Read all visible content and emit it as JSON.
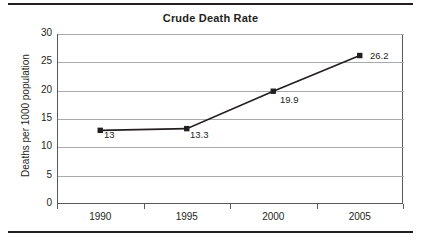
{
  "chart_data": {
    "type": "line",
    "title": "Crude Death Rate",
    "xlabel": "",
    "ylabel": "Deaths per 1000 population",
    "categories": [
      "1990",
      "1995",
      "2000",
      "2005"
    ],
    "values": [
      13,
      13.3,
      19.9,
      26.2
    ],
    "point_labels": [
      "13",
      "13.3",
      "19.9",
      "26.2"
    ],
    "ylim": [
      0,
      30
    ],
    "ytick_values": [
      0,
      5,
      10,
      15,
      20,
      25,
      30
    ],
    "ytick_labels": [
      "0",
      "5",
      "10",
      "15",
      "20",
      "25",
      "30"
    ],
    "grid": true,
    "legend": false,
    "series_color": "#231f20",
    "gridline_color": "#a7a9ac",
    "axis_color": "#58595b",
    "marker": "square"
  },
  "figure": {
    "background_color": "#ffffff",
    "rule_color": "#231f20"
  }
}
